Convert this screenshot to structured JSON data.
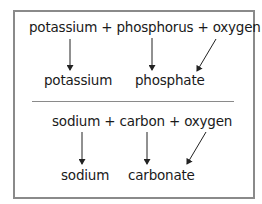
{
  "top_equation": {
    "reactants": "potassium + phosphorus + oxygen",
    "products": [
      "potassium",
      "phosphate"
    ]
  },
  "bottom_equation": {
    "reactants": "sodium + carbon + oxygen",
    "products": [
      "sodium",
      "carbonate"
    ]
  },
  "colors": {
    "border": "#8a8a8a",
    "text": "#1a1a1a",
    "arrow": "#222222"
  }
}
